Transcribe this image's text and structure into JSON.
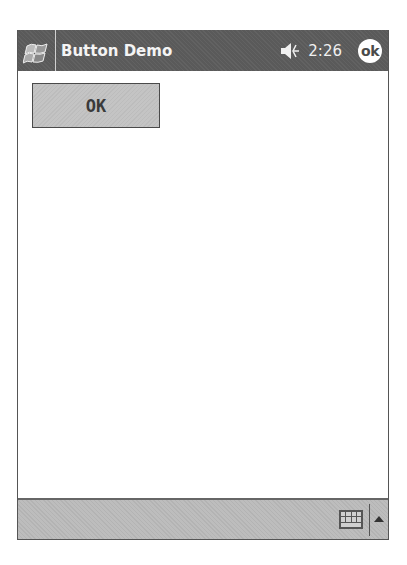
{
  "titlebar": {
    "start_icon": "windows-flag-icon",
    "title": "Button Demo",
    "volume_icon": "speaker-icon",
    "time": "2:26",
    "ok_label": "ok"
  },
  "content": {
    "button_label": "OK"
  },
  "taskbar": {
    "input_icon": "keyboard-icon",
    "input_menu_icon": "up-arrow-icon"
  },
  "colors": {
    "titlebar_bg": "#5a5a5a",
    "button_bg": "#c4c4c4",
    "taskbar_bg": "#bdbdbd"
  }
}
